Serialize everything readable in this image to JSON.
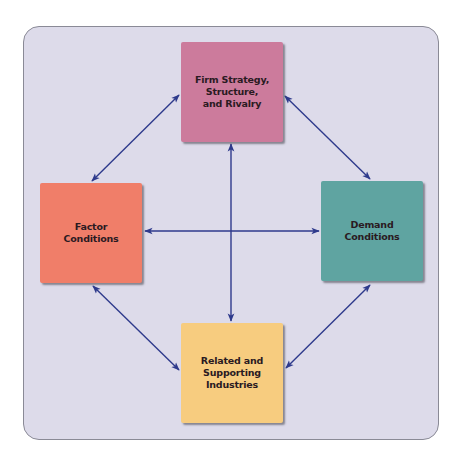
{
  "diagram": {
    "type": "porter-diamond",
    "colors": {
      "panel_bg": "#dddbea",
      "panel_border": "#8a8a96",
      "arrow": "#2e3a8c"
    },
    "nodes": {
      "top": {
        "label": "Firm Strategy,\nStructure,\nand Rivalry",
        "color": "#cc7b9c"
      },
      "left": {
        "label": "Factor\nConditions",
        "color": "#f07e69"
      },
      "right": {
        "label": "Demand\nConditions",
        "color": "#5fa4a1"
      },
      "bottom": {
        "label": "Related and\nSupporting\nIndustries",
        "color": "#f7cc7f"
      }
    },
    "edges": [
      {
        "from": "top",
        "to": "left",
        "bidirectional": true
      },
      {
        "from": "top",
        "to": "right",
        "bidirectional": true
      },
      {
        "from": "left",
        "to": "bottom",
        "bidirectional": true
      },
      {
        "from": "right",
        "to": "bottom",
        "bidirectional": true
      },
      {
        "from": "left",
        "to": "right",
        "bidirectional": true
      },
      {
        "from": "top",
        "to": "bottom",
        "bidirectional": true
      }
    ]
  }
}
